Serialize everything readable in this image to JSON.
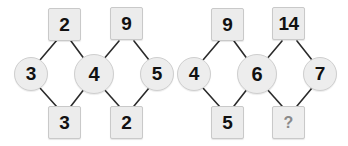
{
  "figure": {
    "background_color": "#ffffff",
    "square_fill": "#ececec",
    "square_border": "#c9c9c9",
    "circle_fill": "#ededed",
    "circle_border": "#cfcfcf",
    "edge_color": "#2b2b2b",
    "text_color": "#111111",
    "unknown_text_color": "#8a8a8a"
  },
  "puzzles": [
    {
      "id": "left-puzzle",
      "squares": {
        "top_left": "2",
        "top_right": "9",
        "bottom_left": "3",
        "bottom_right": "2"
      },
      "circles": {
        "left": "3",
        "center": "4",
        "right": "5"
      }
    },
    {
      "id": "right-puzzle",
      "squares": {
        "top_left": "9",
        "top_right": "14",
        "bottom_left": "5",
        "bottom_right": "?"
      },
      "circles": {
        "left": "4",
        "center": "6",
        "right": "7"
      }
    }
  ],
  "nodes": {
    "l_sq_tl": "2",
    "l_sq_tr": "9",
    "l_sq_bl": "3",
    "l_sq_br": "2",
    "l_ci_l": "3",
    "l_ci_c": "4",
    "l_ci_r": "5",
    "r_sq_tl": "9",
    "r_sq_tr": "14",
    "r_sq_bl": "5",
    "r_sq_br": "?",
    "r_ci_l": "4",
    "r_ci_c": "6",
    "r_ci_r": "7"
  }
}
